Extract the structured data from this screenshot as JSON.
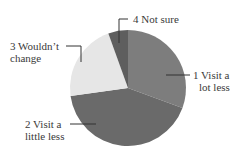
{
  "chart_data": {
    "type": "pie",
    "title": "",
    "categories": [
      "1 Visit a lot less",
      "2 Visit a little less",
      "3 Wouldn't change",
      "4 Not sure"
    ],
    "values": [
      30.6,
      42.2,
      21.7,
      5.5
    ],
    "unit": "percent (estimated from slice angles)",
    "start_angle_deg": 0,
    "direction": "clockwise",
    "colors": [
      "#7d7d7d",
      "#6a6a6a",
      "#e6e6e6",
      "#5e5e5e"
    ],
    "legend": "none (callout labels with leader lines)"
  },
  "labels": {
    "s1_line1": "1 Visit a",
    "s1_line2": "lot less",
    "s2_line1": "2 Visit a",
    "s2_line2": "little less",
    "s3_line1": "3 Wouldn’t",
    "s3_line2": "change",
    "s4_line1": "4 Not sure"
  }
}
